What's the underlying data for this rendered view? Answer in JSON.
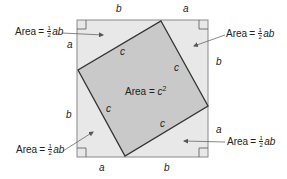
{
  "diagram": {
    "colors": {
      "triangle_fill": "#e8e8e8",
      "inner_square_fill": "#c9c9c9",
      "outer_border": "#8a8a8a",
      "inner_border": "#333333",
      "text": "#222222",
      "arrow": "#555555"
    },
    "outer_square": {
      "x": 77,
      "y": 20,
      "width": 131,
      "height": 137
    },
    "inner_square_vertices": [
      [
        161,
        21
      ],
      [
        208,
        106
      ],
      [
        125,
        156
      ],
      [
        78,
        70
      ]
    ],
    "side_labels": {
      "top_left": "b",
      "top_right": "a",
      "left_upper": "a",
      "left_lower": "b",
      "right_upper": "b",
      "right_lower": "a",
      "bottom_left": "a",
      "bottom_right": "b"
    },
    "hypotenuse_labels": [
      "c",
      "c",
      "c",
      "c"
    ],
    "center_label": {
      "word": "Area",
      "eq": "=",
      "var": "c",
      "exp": "2"
    },
    "triangle_area_labels": [
      {
        "position": "top-left",
        "word": "Area",
        "eq": "=",
        "num": "1",
        "den": "2",
        "vars": "ab"
      },
      {
        "position": "top-right",
        "word": "Area",
        "eq": "=",
        "num": "1",
        "den": "2",
        "vars": "ab"
      },
      {
        "position": "bottom-left",
        "word": "Area",
        "eq": "=",
        "num": "1",
        "den": "2",
        "vars": "ab"
      },
      {
        "position": "bottom-right",
        "word": "Area",
        "eq": "=",
        "num": "1",
        "den": "2",
        "vars": "ab"
      }
    ],
    "right_angle_markers": [
      "top-left",
      "top-right",
      "bottom-left",
      "bottom-right"
    ]
  }
}
